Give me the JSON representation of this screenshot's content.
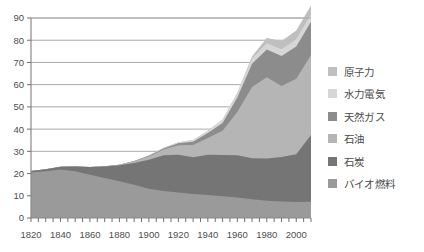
{
  "chart_data": {
    "type": "area",
    "stacked": true,
    "title": "",
    "xlabel": "",
    "ylabel": "",
    "xlim": [
      1820,
      2010
    ],
    "ylim": [
      0,
      90
    ],
    "yticks": [
      0,
      10,
      20,
      30,
      40,
      50,
      60,
      70,
      80,
      90
    ],
    "xticks": [
      1820,
      1840,
      1860,
      1880,
      1900,
      1920,
      1940,
      1960,
      1980,
      2000
    ],
    "xtick_labels": [
      "1820",
      "1840",
      "1860",
      "1880",
      "1900",
      "1920",
      "1940",
      "1960",
      "1980",
      "2000"
    ],
    "ytick_labels": [
      "0",
      "10",
      "20",
      "30",
      "40",
      "50",
      "60",
      "70",
      "80",
      "90"
    ],
    "grid": "horizontal",
    "legend_position": "right",
    "x": [
      1820,
      1830,
      1840,
      1850,
      1860,
      1870,
      1880,
      1890,
      1900,
      1910,
      1920,
      1930,
      1940,
      1950,
      1960,
      1970,
      1980,
      1990,
      2000,
      2010
    ],
    "series": [
      {
        "name": "バイオ燃料",
        "color": "#9a9a9a",
        "values": [
          20.5,
          21.0,
          21.8,
          21.0,
          19.5,
          18.0,
          16.5,
          15.0,
          13.2,
          12.2,
          11.5,
          10.8,
          10.3,
          9.8,
          9.2,
          8.4,
          7.8,
          7.4,
          7.2,
          7.3
        ]
      },
      {
        "name": "石炭",
        "color": "#757575",
        "values": [
          0.6,
          0.9,
          1.3,
          2.2,
          3.5,
          5.2,
          7.2,
          9.8,
          13.0,
          16.0,
          17.0,
          16.5,
          18.2,
          18.5,
          19.0,
          18.5,
          19.0,
          20.0,
          21.5,
          30.0
        ]
      },
      {
        "name": "石油",
        "color": "#b5b5b5",
        "values": [
          0.0,
          0.0,
          0.0,
          0.0,
          0.0,
          0.1,
          0.3,
          0.7,
          1.5,
          2.6,
          4.2,
          5.6,
          7.5,
          11.0,
          19.5,
          32.0,
          36.5,
          32.0,
          34.0,
          36.0
        ]
      },
      {
        "name": "天然ガス",
        "color": "#8c8c8c",
        "values": [
          0.0,
          0.0,
          0.0,
          0.0,
          0.0,
          0.0,
          0.0,
          0.1,
          0.3,
          0.5,
          0.9,
          1.4,
          2.2,
          3.5,
          6.5,
          10.5,
          12.5,
          13.5,
          14.5,
          15.0
        ]
      },
      {
        "name": "水力電気",
        "color": "#d6d6d6",
        "values": [
          0.0,
          0.0,
          0.0,
          0.0,
          0.0,
          0.0,
          0.0,
          0.0,
          0.1,
          0.3,
          0.5,
          0.8,
          1.1,
          1.5,
          2.0,
          2.4,
          2.8,
          3.0,
          3.2,
          3.4
        ]
      },
      {
        "name": "原子力",
        "color": "#bfbfbf",
        "values": [
          0.0,
          0.0,
          0.0,
          0.0,
          0.0,
          0.0,
          0.0,
          0.0,
          0.0,
          0.0,
          0.0,
          0.0,
          0.0,
          0.0,
          0.2,
          1.0,
          2.4,
          3.8,
          4.0,
          3.9
        ]
      }
    ]
  },
  "legend": {
    "items": [
      {
        "label": "原子力",
        "color": "#bfbfbf"
      },
      {
        "label": "水力電気",
        "color": "#d6d6d6"
      },
      {
        "label": "天然ガス",
        "color": "#8c8c8c"
      },
      {
        "label": "石油",
        "color": "#b5b5b5"
      },
      {
        "label": "石炭",
        "color": "#757575"
      },
      {
        "label": "バイオ燃料",
        "color": "#9a9a9a"
      }
    ]
  },
  "axis_style": {
    "axis_color": "#8a8a8a",
    "grid_color": "#a9a9a9",
    "tick_color": "#6f6f6f",
    "text_color": "#4d4d4d"
  }
}
